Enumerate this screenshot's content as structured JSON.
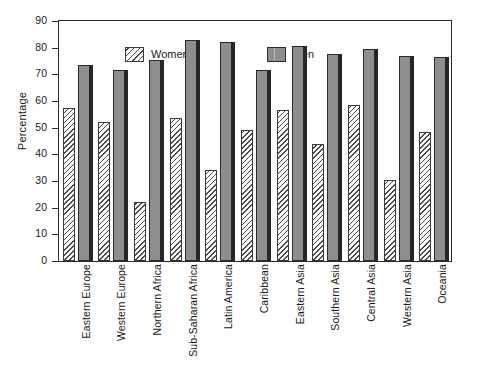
{
  "chart_data": {
    "type": "bar",
    "title": "",
    "xlabel": "",
    "ylabel": "Percentage",
    "ylim": [
      0,
      90
    ],
    "ytick_step": 10,
    "yticks": [
      90,
      80,
      70,
      60,
      50,
      40,
      30,
      20,
      10,
      0
    ],
    "grid": false,
    "legend_position": "top-left inside plot area",
    "categories": [
      "Eastern Europe",
      "Western Europe",
      "Northern Africa",
      "Sub-Saharan Africa",
      "Latin America",
      "Caribbean",
      "Eastern Asia",
      "Southern Asia",
      "Central Asia",
      "Western Asia",
      "Oceania"
    ],
    "series": [
      {
        "name": "Women",
        "color": "#ffffff",
        "pattern": "diagonal-hatch",
        "values": [
          57.5,
          52,
          22,
          53.5,
          34,
          49,
          56.5,
          44,
          58.5,
          30.5,
          48.5
        ]
      },
      {
        "name": "Men",
        "color": "#8e8e8e",
        "pattern": "solid",
        "values": [
          73.5,
          71.5,
          75.5,
          83,
          82,
          71.5,
          80.5,
          77.5,
          79.5,
          77,
          76.5
        ]
      }
    ]
  },
  "legend": {
    "items": [
      {
        "label": "Women",
        "swatch": "hatched-swatch"
      },
      {
        "label": "Men",
        "swatch": "solid-gray-swatch"
      }
    ]
  },
  "axis": {
    "y_title": "Percentage"
  }
}
